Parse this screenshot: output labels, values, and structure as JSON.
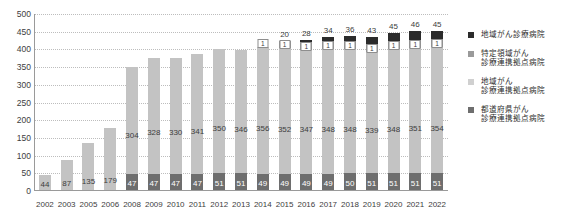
{
  "chart_data": {
    "type": "bar",
    "subtype": "stacked",
    "title": "",
    "xlabel": "",
    "ylabel": "",
    "ylim": [
      0,
      500
    ],
    "ytick_step": 50,
    "grid": true,
    "legend_position": "right",
    "categories": [
      "2002",
      "2003",
      "2005",
      "2006",
      "2008",
      "2009",
      "2010",
      "2011",
      "2012",
      "2013",
      "2014",
      "2015",
      "2016",
      "2017",
      "2018",
      "2019",
      "2020",
      "2021",
      "2022"
    ],
    "yticks": [
      "0",
      "50",
      "100",
      "150",
      "200",
      "250",
      "300",
      "350",
      "400",
      "450",
      "500"
    ],
    "series": [
      {
        "name": "都道府県がん診療連携拠点病院",
        "key": "prefectural",
        "color": "#6e6e6e",
        "values": [
          null,
          null,
          null,
          null,
          47,
          47,
          47,
          47,
          51,
          51,
          49,
          49,
          49,
          49,
          50,
          51,
          51,
          51,
          51
        ]
      },
      {
        "name": "地域がん診療連携拠点病院",
        "key": "regional",
        "color": "#c3c3c3",
        "values": [
          44,
          87,
          135,
          179,
          304,
          328,
          330,
          341,
          350,
          346,
          356,
          352,
          347,
          348,
          348,
          339,
          348,
          351,
          354
        ]
      },
      {
        "name": "特定領域がん診療連携拠点病院",
        "key": "special",
        "color": "#9a9a9a",
        "values": [
          null,
          null,
          null,
          null,
          null,
          null,
          null,
          null,
          null,
          null,
          1,
          1,
          1,
          1,
          1,
          1,
          1,
          1,
          1
        ]
      },
      {
        "name": "地域がん診療病院",
        "key": "hospital",
        "color": "#2b2b2b",
        "values": [
          null,
          null,
          null,
          null,
          null,
          null,
          null,
          null,
          null,
          null,
          null,
          20,
          28,
          34,
          36,
          43,
          45,
          46,
          45
        ]
      }
    ],
    "legend_entries": [
      {
        "label_lines": [
          "地域がん診療病院"
        ],
        "color": "#2b2b2b"
      },
      {
        "label_lines": [
          "特定領域がん",
          "診療連携拠点病院"
        ],
        "color": "#9a9a9a"
      },
      {
        "label_lines": [
          "地域がん",
          "診療連携拠点病院"
        ],
        "color": "#d0d0d0"
      },
      {
        "label_lines": [
          "都道府県がん",
          "診療連携拠点病院"
        ],
        "color": "#6e6e6e"
      }
    ]
  }
}
